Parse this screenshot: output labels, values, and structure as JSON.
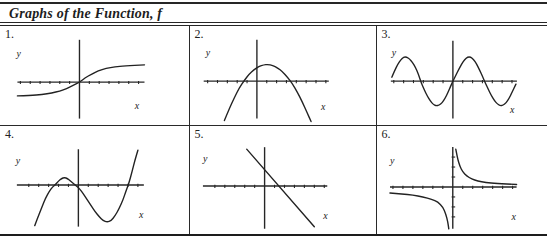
{
  "style": {
    "paper": "#ffffff",
    "ink": "#262626",
    "curve_ink": "#222222"
  },
  "header": {
    "title": "Graphs of the Function, f"
  },
  "chart_data": [
    {
      "id": "1.",
      "type": "line",
      "shape": "increasing sigmoid (S-shaped) curve through the origin with horizontal asymptotes on both sides",
      "xlabel": "x",
      "ylabel": "y",
      "axes": {
        "origin_x": 80,
        "axis_y": 57,
        "v_top": 14,
        "v_bottom": 94,
        "h_left": 17,
        "h_right": 146,
        "x_ticks": true,
        "y_ticks": false,
        "tick_step": 10
      },
      "label_pos": {
        "y": [
          16,
          31
        ],
        "x": [
          136,
          84
        ]
      },
      "paths": [
        [
          [
            17,
            71
          ],
          [
            30,
            70.5
          ],
          [
            42,
            69.5
          ],
          [
            52,
            68
          ],
          [
            60,
            66
          ],
          [
            67,
            63.5
          ],
          [
            73,
            60.5
          ],
          [
            80,
            57
          ],
          [
            86,
            52.5
          ],
          [
            92,
            49
          ],
          [
            99,
            45.5
          ],
          [
            107,
            43
          ],
          [
            116,
            41.5
          ],
          [
            126,
            40.5
          ],
          [
            146,
            39.5
          ]
        ]
      ]
    },
    {
      "id": "2.",
      "type": "line",
      "shape": "downward-opening parabola, vertex above the x-axis slightly right of the y-axis",
      "xlabel": "x",
      "ylabel": "y",
      "axes": {
        "origin_x": 67,
        "axis_y": 56,
        "v_top": 14,
        "v_bottom": 94,
        "h_left": 13,
        "h_right": 140,
        "x_ticks": true,
        "y_ticks": false,
        "tick_step": 10
      },
      "label_pos": {
        "y": [
          15,
          30
        ],
        "x": [
          132,
          85
        ]
      },
      "paths": [
        [
          [
            34,
            96
          ],
          [
            39,
            84
          ],
          [
            44,
            73
          ],
          [
            49,
            63
          ],
          [
            54,
            55.5
          ],
          [
            59,
            49
          ],
          [
            64,
            44.5
          ],
          [
            69,
            41
          ],
          [
            74,
            39.5
          ],
          [
            78,
            39
          ],
          [
            83,
            40
          ],
          [
            88,
            42.5
          ],
          [
            93,
            46.5
          ],
          [
            98,
            52
          ],
          [
            103,
            58.5
          ],
          [
            108,
            67
          ],
          [
            113,
            77
          ],
          [
            118,
            88
          ],
          [
            122,
            97
          ]
        ]
      ]
    },
    {
      "id": "3.",
      "type": "line",
      "shape": "sine wave through the origin, two full periods visible",
      "xlabel": "x",
      "ylabel": "y",
      "axes": {
        "origin_x": 76,
        "axis_y": 56,
        "v_top": 15,
        "v_bottom": 94,
        "h_left": 13,
        "h_right": 141,
        "x_ticks": true,
        "y_ticks": false,
        "tick_step": 10
      },
      "label_pos": {
        "y": [
          14,
          30
        ],
        "x": [
          134,
          88
        ]
      },
      "paths": [
        [
          [
            14,
            52
          ],
          [
            17,
            45
          ],
          [
            20,
            39
          ],
          [
            23,
            34.5
          ],
          [
            26,
            31.5
          ],
          [
            29,
            31.5
          ],
          [
            32,
            33.5
          ],
          [
            35,
            37
          ],
          [
            38,
            42
          ],
          [
            41,
            49
          ],
          [
            44,
            58
          ],
          [
            47,
            65
          ],
          [
            50,
            71
          ],
          [
            53,
            76
          ],
          [
            56,
            79.5
          ],
          [
            59,
            81
          ],
          [
            62,
            80.5
          ],
          [
            65,
            78
          ],
          [
            68,
            73.5
          ],
          [
            71,
            67.5
          ],
          [
            74,
            60.5
          ],
          [
            76,
            56
          ],
          [
            79,
            50
          ],
          [
            82,
            44
          ],
          [
            85,
            38.5
          ],
          [
            88,
            34
          ],
          [
            91,
            31.5
          ],
          [
            94,
            31.5
          ],
          [
            97,
            34
          ],
          [
            100,
            38.5
          ],
          [
            103,
            44.5
          ],
          [
            106,
            51
          ],
          [
            109,
            58
          ],
          [
            112,
            64.5
          ],
          [
            115,
            70.5
          ],
          [
            118,
            75.5
          ],
          [
            121,
            79
          ],
          [
            124,
            81
          ],
          [
            127,
            80.5
          ],
          [
            130,
            78
          ],
          [
            133,
            73.5
          ],
          [
            136,
            67.5
          ],
          [
            140,
            59
          ]
        ]
      ]
    },
    {
      "id": "4.",
      "type": "line",
      "shape": "cubic curve: local maximum just left of the y-axis above the x-axis, local minimum right of the y-axis below the x-axis, rising steeply to the right",
      "xlabel": "x",
      "ylabel": "y",
      "axes": {
        "origin_x": 79,
        "axis_y": 59,
        "v_top": 23,
        "v_bottom": 101,
        "h_left": 17,
        "h_right": 145,
        "x_ticks": true,
        "y_ticks": false,
        "tick_step": 10
      },
      "label_pos": {
        "y": [
          16,
          38
        ],
        "x": [
          140,
          92
        ]
      },
      "paths": [
        [
          [
            35,
            100
          ],
          [
            38,
            92
          ],
          [
            42,
            82
          ],
          [
            46,
            72
          ],
          [
            50,
            65
          ],
          [
            53,
            61
          ],
          [
            56,
            58.5
          ],
          [
            59,
            55
          ],
          [
            62,
            52.5
          ],
          [
            65,
            51.5
          ],
          [
            68,
            52.5
          ],
          [
            71,
            55
          ],
          [
            74,
            57.5
          ],
          [
            77,
            60
          ],
          [
            80,
            62.5
          ],
          [
            84,
            68
          ],
          [
            88,
            74
          ],
          [
            92,
            80
          ],
          [
            96,
            86
          ],
          [
            100,
            91
          ],
          [
            104,
            95
          ],
          [
            108,
            96.5
          ],
          [
            112,
            95
          ],
          [
            116,
            90
          ],
          [
            120,
            83
          ],
          [
            124,
            74
          ],
          [
            127,
            65
          ],
          [
            130,
            57
          ],
          [
            133,
            46
          ],
          [
            136,
            34
          ],
          [
            139,
            24
          ]
        ]
      ]
    },
    {
      "id": "5.",
      "type": "line",
      "shape": "straight line with negative slope, positive y-intercept, crossing the x-axis right of the origin",
      "xlabel": "x",
      "ylabel": "y",
      "axes": {
        "origin_x": 75,
        "axis_y": 60,
        "v_top": 21,
        "v_bottom": 103,
        "h_left": 13,
        "h_right": 138,
        "x_ticks": true,
        "y_ticks": false,
        "tick_step": 10
      },
      "label_pos": {
        "y": [
          13,
          36
        ],
        "x": [
          134,
          93
        ]
      },
      "paths": [
        [
          [
            57,
            23
          ],
          [
            125,
            101
          ]
        ]
      ]
    },
    {
      "id": "6.",
      "type": "line",
      "shape": "reciprocal-type hyperbola: branch in upper-right quadrant and branch in lower-left quadrant, asymptotic to both axes",
      "xlabel": "x",
      "ylabel": "y",
      "axes": {
        "origin_x": 76,
        "axis_y": 61,
        "v_top": 21,
        "v_bottom": 103,
        "h_left": 13,
        "h_right": 140,
        "x_ticks": true,
        "y_ticks": true,
        "tick_step": 10
      },
      "label_pos": {
        "y": [
          13,
          38
        ],
        "x": [
          135,
          94
        ]
      },
      "paths": [
        [
          [
            79,
            23
          ],
          [
            80,
            28
          ],
          [
            81,
            33
          ],
          [
            83,
            40
          ],
          [
            86,
            46
          ],
          [
            90,
            50
          ],
          [
            95,
            53
          ],
          [
            101,
            55
          ],
          [
            109,
            56.5
          ],
          [
            120,
            57.5
          ],
          [
            140,
            58.5
          ]
        ],
        [
          [
            13,
            67
          ],
          [
            25,
            68
          ],
          [
            36,
            69
          ],
          [
            46,
            71
          ],
          [
            55,
            73.5
          ],
          [
            61,
            76
          ],
          [
            66,
            81
          ],
          [
            69,
            88
          ],
          [
            71,
            96
          ],
          [
            72,
            103
          ]
        ]
      ]
    }
  ]
}
